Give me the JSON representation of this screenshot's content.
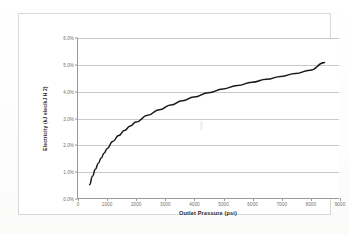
{
  "document": {
    "kind": "scanned-chart",
    "background_color": "#fdfdfc",
    "frame_color": "#d8d8d6"
  },
  "chart_data": {
    "type": "line",
    "title": "",
    "subtitle": "",
    "xlabel": "Outlet Pressure (psi)",
    "ylabel": "Electricity (kJ elec/kJ H 2)",
    "xlim": [
      0,
      9000
    ],
    "ylim": [
      0,
      6
    ],
    "grid": true,
    "legend": false,
    "legend_position": "none",
    "line_color": "#1a1a1a",
    "grid_color": "#c9c9c9",
    "axis_color": "#9a9a9a",
    "x_ticks": [
      0,
      1000,
      2000,
      3000,
      4000,
      5000,
      6000,
      7000,
      8000,
      9000
    ],
    "x_tick_labels": [
      "0",
      "1000",
      "2000",
      "3000",
      "4000",
      "5000",
      "6000",
      "7000",
      "8000",
      "9000"
    ],
    "y_ticks": [
      0,
      1,
      2,
      3,
      4,
      5,
      6
    ],
    "y_tick_labels": [
      "0.0%",
      "1.0%",
      "2.0%",
      "3.0%",
      "4.0%",
      "5.0%",
      "6.0%"
    ],
    "series": [
      {
        "name": "Electricity",
        "x": [
          400,
          500,
          600,
          700,
          800,
          900,
          1000,
          1200,
          1400,
          1600,
          1800,
          2000,
          2400,
          2800,
          3200,
          3600,
          4000,
          4500,
          5000,
          5500,
          6000,
          6500,
          7000,
          7500,
          8000,
          8500
        ],
        "values": [
          0.5,
          0.82,
          1.08,
          1.3,
          1.5,
          1.68,
          1.85,
          2.12,
          2.34,
          2.53,
          2.7,
          2.85,
          3.1,
          3.31,
          3.49,
          3.65,
          3.79,
          3.95,
          4.09,
          4.22,
          4.34,
          4.45,
          4.56,
          4.67,
          4.79,
          5.08
        ]
      }
    ]
  }
}
